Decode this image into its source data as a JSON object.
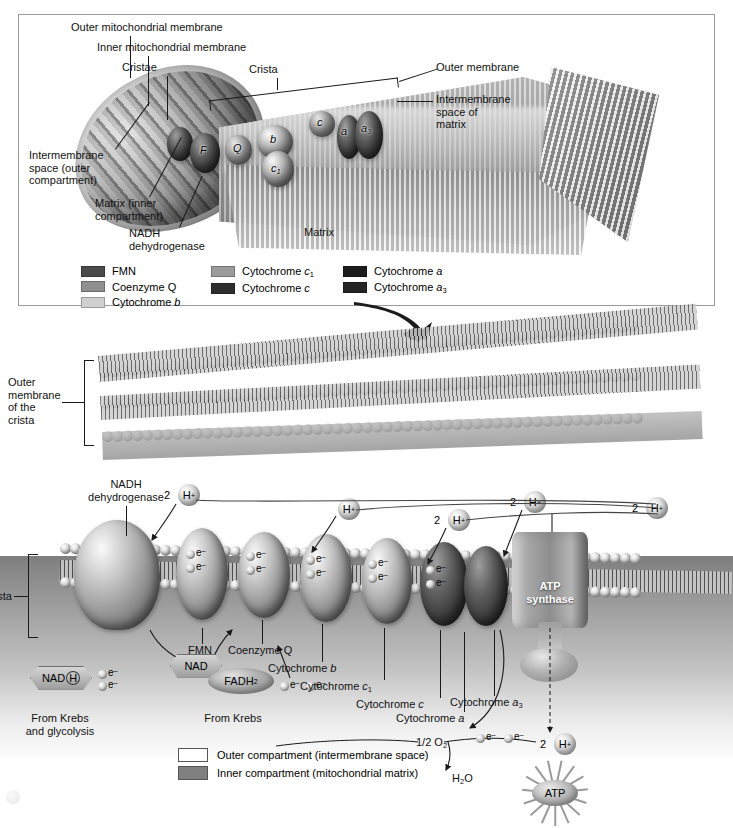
{
  "top_panel": {
    "labels": {
      "outer_mitochondrial_membrane": "Outer mitochondrial membrane",
      "inner_mitochondrial_membrane": "Inner mitochondrial membrane",
      "cristae": "Cristae",
      "crista": "Crista",
      "outer_membrane": "Outer membrane",
      "intermembrane_space_of_matrix": "Intermembrane\nspace of\nmatrix",
      "intermembrane_space_outer": "Intermembrane\nspace (outer\ncompartment)",
      "matrix_inner": "Matrix (inner\ncompartment)",
      "nadh_dehydrogenase": "NADH\ndehydrogenase",
      "matrix": "Matrix"
    },
    "complex_markers": [
      {
        "label": "F",
        "sub": ""
      },
      {
        "label": "Q",
        "sub": ""
      },
      {
        "label": "b",
        "sub": ""
      },
      {
        "label": "c",
        "sub": "1"
      },
      {
        "label": "c",
        "sub": ""
      },
      {
        "label": "a",
        "sub": ""
      },
      {
        "label": "a",
        "sub": "3"
      }
    ]
  },
  "legend_top": {
    "column1": [
      {
        "label": "FMN",
        "color": "#4a4a4a"
      },
      {
        "label": "Coenzyme Q",
        "color": "#8f8f8f"
      },
      {
        "label": "Cytochrome b",
        "color": "#cfcfcf",
        "italic_tail": "b"
      }
    ],
    "column2": [
      {
        "label": "Cytochrome c1",
        "color": "#9b9b9b"
      },
      {
        "label": "Cytochrome c",
        "color": "#2e2e2e"
      }
    ],
    "column3": [
      {
        "label": "Cytochrome a",
        "color": "#1c1c1c"
      },
      {
        "label": "Cytochrome a3",
        "color": "#242424"
      }
    ]
  },
  "mid_panel": {
    "outer_membrane_of_crista": "Outer\nmembrane\nof the\ncrista"
  },
  "bottom_panel": {
    "crista_bracket": "Crista",
    "nadh_dehydrogenase": "NADH\ndehydrogenase",
    "proton_labels": [
      {
        "count": "2",
        "ion": "H",
        "charge": "+"
      },
      {
        "count": "",
        "ion": "H",
        "charge": "+"
      },
      {
        "count": "2",
        "ion": "H",
        "charge": "+"
      },
      {
        "count": "2",
        "ion": "H",
        "charge": "+"
      },
      {
        "count": "2",
        "ion": "H",
        "charge": "+"
      }
    ],
    "atp_synthase": "ATP\nsynthase",
    "carrier_labels": {
      "fmn": "FMN",
      "coenzyme_q": "Coenzyme Q",
      "cytochrome_b": "Cytochrome b",
      "cytochrome_c1": "Cytochrome c1",
      "cytochrome_c": "Cytochrome c",
      "cytochrome_a": "Cytochrome a",
      "cytochrome_a3": "Cytochrome a3"
    },
    "molecules": {
      "nadh": "NADH",
      "nad": "NAD",
      "fadh2": "FADH2",
      "oxygen": "1/2 O2",
      "water": "H2O",
      "atp": "ATP"
    },
    "source_labels": {
      "from_krebs_and_glycolysis": "From Krebs\nand glycolysis",
      "from_krebs": "From Krebs"
    },
    "electron_label": "e"
  },
  "legend_bottom": [
    {
      "label": "Outer compartment (intermembrane space)",
      "color": "#ffffff"
    },
    {
      "label": "Inner compartment (mitochondrial matrix)",
      "color": "#808080"
    }
  ]
}
